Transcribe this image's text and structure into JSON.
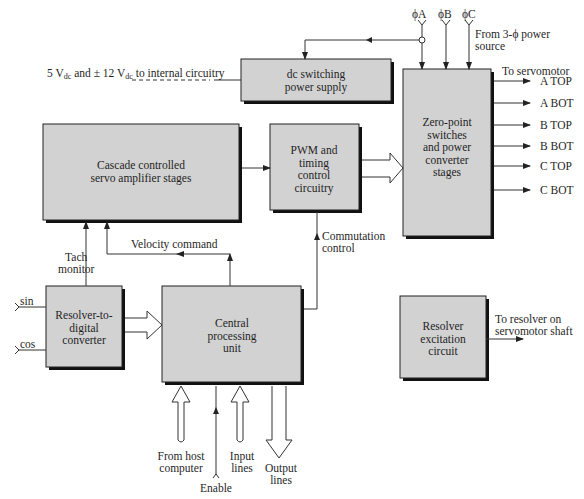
{
  "diagram": {
    "title": "",
    "blocks": {
      "dc_supply": [
        "dc switching",
        "power supply"
      ],
      "zero_point": [
        "Zero-point",
        "switches",
        "and power",
        "converter",
        "stages"
      ],
      "cascade": [
        "Cascade controlled",
        "servo amplifier stages"
      ],
      "pwm": [
        "PWM and",
        "timing",
        "control",
        "circuitry"
      ],
      "rdc": [
        "Resolver-to-",
        "digital",
        "converter"
      ],
      "cpu": [
        "Central",
        "processing",
        "unit"
      ],
      "excitation": [
        "Resolver",
        "excitation",
        "circuit"
      ]
    },
    "labels": {
      "supply_out_a": "5 V",
      "supply_out_sub1": "dc",
      "supply_out_b": " and ± 12 V",
      "supply_out_sub2": "dc",
      "supply_out_c": " to internal circuitry",
      "phase_a": "ϕA",
      "phase_b": "ϕB",
      "phase_c": "ϕC",
      "power_source_1": "From 3-ϕ power",
      "power_source_2": "source",
      "to_servomotor": "To servomotor",
      "tach_1": "Tach",
      "tach_2": "monitor",
      "velocity": "Velocity command",
      "commutation_1": "Commutation",
      "commutation_2": "control",
      "sin": "sin",
      "cos": "cos",
      "host_1": "From host",
      "host_2": "computer",
      "input_1": "Input",
      "input_2": "lines",
      "output_1": "Output",
      "output_2": "lines",
      "enable": "Enable",
      "resolver_out_1": "To resolver on",
      "resolver_out_2": "servomotor shaft"
    },
    "outputs": [
      "A TOP",
      "A BOT",
      "B TOP",
      "B BOT",
      "C TOP",
      "C BOT"
    ]
  }
}
